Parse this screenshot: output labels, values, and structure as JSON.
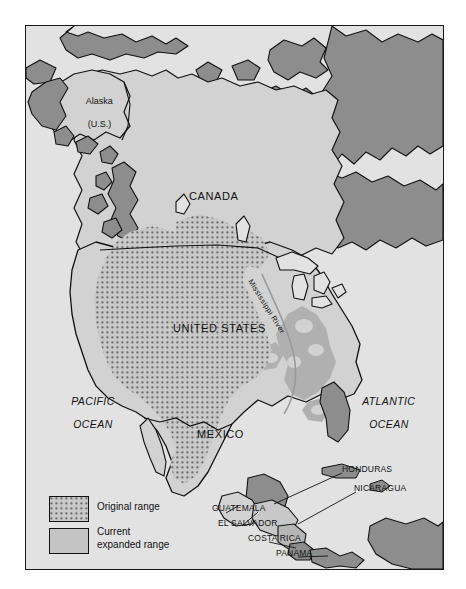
{
  "map": {
    "title": "Range map of North America",
    "frame": {
      "x": 25,
      "y": 25,
      "w": 417,
      "h": 543
    },
    "background_color": "#e2e2e2",
    "colors": {
      "ocean": "#e2e2e2",
      "land_light": "#d2d2d2",
      "current_expanded_range": "#b9b9b9",
      "outside_range_land": "#8d8d8d",
      "original_range_dots": "#6b6b6b",
      "outline": "#111111",
      "river": "#9a9a9a"
    },
    "country_labels": [
      {
        "name": "canada",
        "text": "CANADA",
        "x": 188,
        "y": 195,
        "style": "country"
      },
      {
        "name": "united-states",
        "text": "UNITED STATES",
        "x": 172,
        "y": 327,
        "style": "country"
      },
      {
        "name": "mexico",
        "text": "MEXICO",
        "x": 196,
        "y": 433,
        "style": "country"
      }
    ],
    "alaska_label": {
      "name": "alaska",
      "line1": "Alaska",
      "line2": "(U.S.)",
      "x": 62,
      "y": 84
    },
    "river_label": {
      "name": "mississippi-river",
      "text": "Mississippi River",
      "x": 252,
      "y": 281,
      "rotation_deg": 58
    },
    "ocean_labels": [
      {
        "name": "pacific-ocean",
        "line1": "PACIFIC",
        "line2": "OCEAN",
        "x": 46,
        "y": 391
      },
      {
        "name": "atlantic-ocean",
        "line1": "ATLANTIC",
        "line2": "OCEAN",
        "x": 352,
        "y": 391
      }
    ],
    "central_america_labels": [
      {
        "name": "honduras",
        "text": "HONDURAS",
        "x": 366,
        "y": 470
      },
      {
        "name": "nicaragua",
        "text": "NICARAGUA",
        "x": 372,
        "y": 489
      },
      {
        "name": "guatemala",
        "text": "GUATEMALA",
        "x": 239,
        "y": 508
      },
      {
        "name": "el-salvador",
        "text": "EL SALVADOR",
        "x": 249,
        "y": 523
      },
      {
        "name": "costa-rica",
        "text": "COSTA RICA",
        "x": 276,
        "y": 538
      },
      {
        "name": "panama",
        "text": "PANAMA",
        "x": 304,
        "y": 553
      }
    ]
  },
  "legend": {
    "name": "map-legend",
    "items": [
      {
        "name": "legend-original-range",
        "label": "Original range",
        "swatch": "dotted",
        "swatch_fill": "#cfcfcf",
        "dot_color": "#6b6b6b"
      },
      {
        "name": "legend-current-expanded-range",
        "label": "Current\nexpanded range",
        "swatch": "solid",
        "swatch_fill": "#c4c4c4"
      }
    ]
  }
}
